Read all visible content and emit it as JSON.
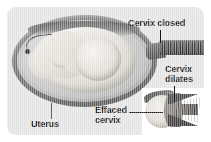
{
  "illustration": {
    "title": "Cervical effacement and dilation during labor",
    "style": "grayscale medical diagram",
    "panel_background": "#e3e3e3",
    "inset_background": "#ffffff",
    "text_color": "#141414"
  },
  "labels": {
    "cervix_closed": "Cervix closed",
    "cervix_dilates": "Cervix\ndilates",
    "effaced_cervix": "Effaced\ncervix",
    "uterus": "Uterus"
  },
  "parts": {
    "uterus_wall": "uterus-wall",
    "fetus": "fetus",
    "cervix_tube": "closed-cervix-canal",
    "inset_cone": "effaced-dilating-cervix"
  }
}
